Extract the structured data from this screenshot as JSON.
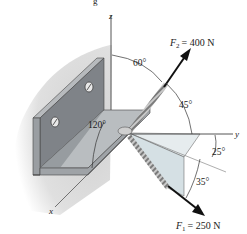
{
  "figure": {
    "caption_fragment": "g",
    "axes": {
      "x_label": "x",
      "y_label": "y",
      "z_label": "z"
    },
    "forces": [
      {
        "name": "F",
        "subscript": "2",
        "value": "= 400 N",
        "direction": "up-right"
      },
      {
        "name": "F",
        "subscript": "1",
        "value": "= 250 N",
        "direction": "down-right"
      }
    ],
    "angles": {
      "a60": "60°",
      "a45": "45°",
      "a120": "120°",
      "a25": "25°",
      "a35": "35°"
    },
    "colors": {
      "plate_dark": "#7d8186",
      "plate_mid": "#a3a7ab",
      "plate_light": "#c6c9cc",
      "wall_shade": "#d9d9d9",
      "projection_fill": "#dfe7ea",
      "arrow": "#111111"
    }
  }
}
